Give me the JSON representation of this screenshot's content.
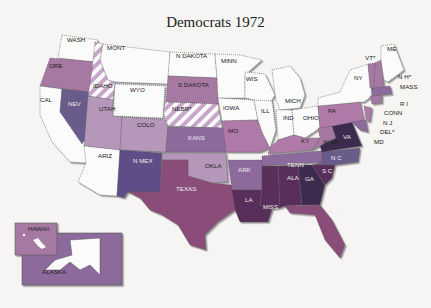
{
  "title": "Democrats 1972",
  "colors": {
    "white": "#fbfbfb",
    "hatch_a": "#c7a6c9",
    "mauve": "#a679a3",
    "light_purple": "#b497b9",
    "blue_purple": "#6b5c8a",
    "purple": "#8c6a9c",
    "red_purple": "#8a4e7a",
    "dark_plum": "#5a2f5a",
    "darkest": "#3d2b4f",
    "pink": "#b07aa8"
  },
  "states": [
    {
      "label": "WASH",
      "x": 67,
      "y": 42
    },
    {
      "label": "MONT",
      "x": 107,
      "y": 50
    },
    {
      "label": "N DAKOTA",
      "x": 176,
      "y": 58
    },
    {
      "label": "MINN",
      "x": 221,
      "y": 63
    },
    {
      "label": "ORE",
      "x": 49,
      "y": 68
    },
    {
      "label": "IDAHO",
      "x": 93,
      "y": 88
    },
    {
      "label": "WYO",
      "x": 130,
      "y": 92
    },
    {
      "label": "S DAKOTA",
      "x": 178,
      "y": 87
    },
    {
      "label": "WIS",
      "x": 246,
      "y": 81
    },
    {
      "label": "MICH",
      "x": 285,
      "y": 103
    },
    {
      "label": "NY",
      "x": 354,
      "y": 80
    },
    {
      "label": "CAL",
      "x": 40,
      "y": 102
    },
    {
      "label": "NEV",
      "x": 68,
      "y": 106
    },
    {
      "label": "UTAH",
      "x": 99,
      "y": 111
    },
    {
      "label": "NEBR*",
      "x": 172,
      "y": 111
    },
    {
      "label": "IOWA",
      "x": 223,
      "y": 110
    },
    {
      "label": "ILL",
      "x": 261,
      "y": 113
    },
    {
      "label": "IND",
      "x": 283,
      "y": 120
    },
    {
      "label": "OHIO",
      "x": 303,
      "y": 120
    },
    {
      "label": "PA",
      "x": 328,
      "y": 113
    },
    {
      "label": "COLO",
      "x": 137,
      "y": 127
    },
    {
      "label": "KANS",
      "x": 188,
      "y": 140
    },
    {
      "label": "MO",
      "x": 228,
      "y": 133
    },
    {
      "label": "KY",
      "x": 301,
      "y": 143
    },
    {
      "label": "W VA",
      "x": 323,
      "y": 144
    },
    {
      "label": "VA",
      "x": 343,
      "y": 139
    },
    {
      "label": "ARIZ",
      "x": 98,
      "y": 158
    },
    {
      "label": "N MEX",
      "x": 133,
      "y": 163
    },
    {
      "label": "OKLA",
      "x": 205,
      "y": 168
    },
    {
      "label": "ARK",
      "x": 238,
      "y": 172
    },
    {
      "label": "TENN",
      "x": 287,
      "y": 167
    },
    {
      "label": "N C",
      "x": 331,
      "y": 160
    },
    {
      "label": "S C",
      "x": 322,
      "y": 173
    },
    {
      "label": "TEXAS",
      "x": 176,
      "y": 191
    },
    {
      "label": "ALA",
      "x": 287,
      "y": 180
    },
    {
      "label": "GA",
      "x": 305,
      "y": 181
    },
    {
      "label": "LA",
      "x": 245,
      "y": 202
    },
    {
      "label": "MISS",
      "x": 263,
      "y": 209
    },
    {
      "label": "FLA",
      "x": 328,
      "y": 214
    },
    {
      "label": "ME",
      "x": 387,
      "y": 51
    },
    {
      "label": "VT*",
      "x": 365,
      "y": 60
    },
    {
      "label": "N H*",
      "x": 398,
      "y": 79
    },
    {
      "label": "MASS",
      "x": 400,
      "y": 89
    },
    {
      "label": "R I",
      "x": 400,
      "y": 106
    },
    {
      "label": "CONN",
      "x": 384,
      "y": 115
    },
    {
      "label": "N J",
      "x": 383,
      "y": 125
    },
    {
      "label": "DEL*",
      "x": 380,
      "y": 134
    },
    {
      "label": "MD",
      "x": 374,
      "y": 144
    }
  ],
  "inset": {
    "hawaii_label": "HAWAII",
    "alaska_label": "ALASKA"
  }
}
